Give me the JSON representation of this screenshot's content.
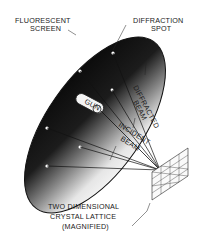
{
  "diagram": {
    "type": "LEED electron diffraction schematic",
    "labels": {
      "screen_line1": "FLUORESCENT",
      "screen_line2": "SCREEN",
      "spot_line1": "DIFFRACTION",
      "spot_line2": "SPOT",
      "diffracted_line1": "DIFFRACTED",
      "diffracted_line2": "BEAM",
      "gun": "GUN",
      "incident_line1": "INCIDENT",
      "incident_line2": "BEAM",
      "lattice_line1": "TWO DIMENSIONAL",
      "lattice_line2": "CRYSTAL LATTICE",
      "lattice_line3": "(MAGNIFIED)"
    },
    "colors": {
      "background": "#ffffff",
      "screen_dark": "#0d0d0d",
      "screen_light": "#f2f2f2",
      "ink": "#1a1a1a"
    }
  }
}
